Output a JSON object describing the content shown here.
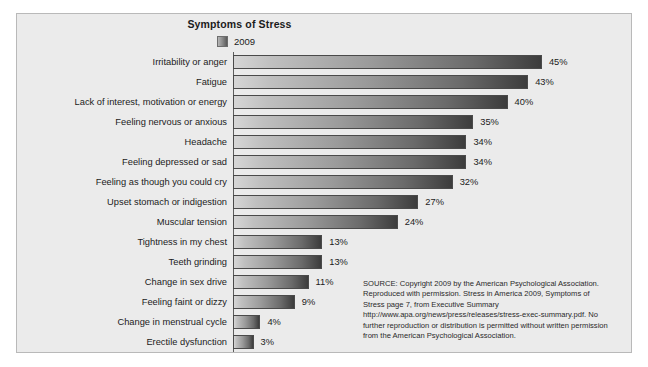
{
  "figure": {
    "title": "Symptoms of Stress",
    "legend": {
      "swatch_name": "series-swatch-2009",
      "label": "2009"
    },
    "source_note": "SOURCE: Copyright 2009 by the American Psychological Association.  Reproduced with permission. Stress in America 2009, Symptoms of Stress page 7, from Executive Summary http://www.apa.org/news/press/releases/stress-exec-summary.pdf. No further reproduction or distribution is permitted without written permission from the American Psychological Association.",
    "colors": {
      "panel_background": "#ebebeb",
      "panel_border": "#b9b9b9",
      "bar_light": "#d6d6d6",
      "bar_dark": "#3c3c3c",
      "bar_outline": "#4a4a4a",
      "text": "#1b1b1b"
    }
  },
  "chart_data": {
    "type": "bar",
    "orientation": "horizontal",
    "title": "Symptoms of Stress",
    "xlabel": "",
    "ylabel": "",
    "xlim": [
      0,
      50
    ],
    "grid": false,
    "legend_position": "top",
    "series": [
      {
        "name": "2009",
        "values": [
          45,
          43,
          40,
          35,
          34,
          34,
          32,
          27,
          24,
          13,
          13,
          11,
          9,
          4,
          3
        ]
      }
    ],
    "categories": [
      "Irritability or anger",
      "Fatigue",
      "Lack of interest, motivation or energy",
      "Feeling nervous or anxious",
      "Headache",
      "Feeling depressed or sad",
      "Feeling as though you could cry",
      "Upset stomach or indigestion",
      "Muscular tension",
      "Tightness in my chest",
      "Teeth grinding",
      "Change in sex drive",
      "Feeling faint or dizzy",
      "Change in menstrual cycle",
      "Erectile dysfunction"
    ],
    "data_labels": [
      "45%",
      "43%",
      "40%",
      "35%",
      "34%",
      "34%",
      "32%",
      "27%",
      "24%",
      "13%",
      "13%",
      "11%",
      "9%",
      "4%",
      "3%"
    ]
  }
}
